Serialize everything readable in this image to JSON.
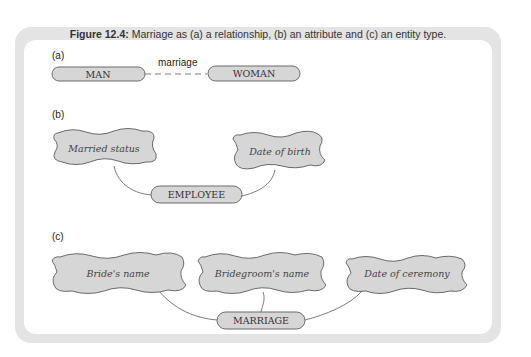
{
  "caption": {
    "figure_label": "Figure 12.4:",
    "text": " Marriage as (a) a relationship, (b) an attribute and (c) an entity type."
  },
  "colors": {
    "frame": "#e4e4e4",
    "shape_fill": "#d6d6d6",
    "shape_stroke": "#6a6a6a",
    "line": "#6a6a6a",
    "text": "#333333"
  },
  "part_a": {
    "label": "(a)",
    "entity_left": "MAN",
    "entity_right": "WOMAN",
    "relationship": "marriage"
  },
  "part_b": {
    "label": "(b)",
    "attributes": [
      "Married status",
      "Date of birth"
    ],
    "entity": "EMPLOYEE"
  },
  "part_c": {
    "label": "(c)",
    "attributes": [
      "Bride's name",
      "Bridegroom's name",
      "Date of ceremony"
    ],
    "entity": "MARRIAGE"
  }
}
